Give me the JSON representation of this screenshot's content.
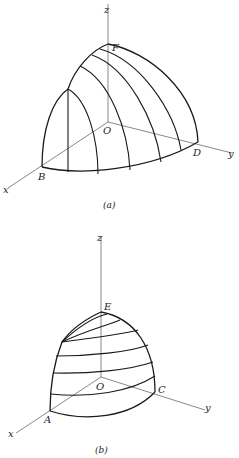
{
  "figures": [
    {
      "id": "a",
      "caption": "(a)",
      "axis_labels": {
        "x": "x",
        "y": "y",
        "z": "z"
      },
      "point_labels": {
        "origin": "O",
        "top": "F",
        "x_point": "B",
        "y_point": "D"
      },
      "description": "Octant of a solid with meridian curves (vertical sections) running from B-arc to D"
    },
    {
      "id": "b",
      "caption": "(b)",
      "axis_labels": {
        "x": "x",
        "y": "y",
        "z": "z"
      },
      "point_labels": {
        "origin": "O",
        "top": "E",
        "x_point": "A",
        "y_point": "C"
      },
      "description": "Octant of a solid with horizontal latitude-like section curves"
    }
  ]
}
